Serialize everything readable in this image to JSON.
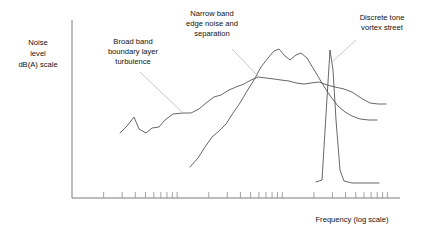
{
  "chart_data": {
    "type": "line",
    "title": "",
    "xlabel": "Frequency (log scale)",
    "ylabel": "Noise level dB(A) scale",
    "xscale": "log",
    "grid": false,
    "legend": "none",
    "axis_ticks_labeled": false,
    "annotations": [
      {
        "id": "broad-band",
        "lines": [
          "Broad band",
          "boundary layer",
          "turbulence"
        ],
        "text": "Broad band boundary layer turbulence",
        "anchor_x": 183,
        "anchor_y": 113
      },
      {
        "id": "narrow-band",
        "lines": [
          "Narrow band",
          "edge noise and",
          "separation"
        ],
        "text": "Narrow band edge noise and separation",
        "anchor_x": 258,
        "anchor_y": 77
      },
      {
        "id": "discrete-tone",
        "lines": [
          "Discrete tone",
          "vortex street"
        ],
        "text": "Discrete tone vortex street",
        "anchor_x": 332,
        "anchor_y": 62
      }
    ],
    "series": [
      {
        "name": "Broad band boundary layer turbulence",
        "points": "120,133 127,126 134,117 139,129 146,133 152,128 159,127 165,120 173,114 183,113 191,113 199,109 206,103 214,97 221,95 229,90 236,87 244,84 251,80 258,77 266,78 274,79 281,80 289,81 296,83 304,84 311,83 319,82 327,85 335,87 344,89 352,92 361,98 370,103 378,104 386,104"
      },
      {
        "name": "Narrow band edge noise and separation",
        "points": "190,167 198,158 205,147 212,137 219,131 226,124 233,113 240,103 247,91 254,80 261,67 268,58 274,51 279,49 285,56 290,60 296,55 301,53 307,58 313,68 319,78 325,88 331,97 338,106 345,112 352,116 360,119 369,120 377,120"
      },
      {
        "name": "Discrete tone vortex street",
        "points": "316,182 322,180 327,98 330,50 333,70 336,120 340,170 344,181 352,183 361,183 370,183 379,183"
      }
    ],
    "axes": {
      "x_start": 72,
      "x_end": 400,
      "y_top": 20,
      "y_bottom": 198,
      "decades": 3,
      "ticks_per_decade": 9
    }
  },
  "labels": {
    "y_axis_line1": "Noise",
    "y_axis_line2": "level",
    "y_axis_line3": "dB(A) scale",
    "x_axis": "Frequency (log scale)",
    "broad_band_line1": "Broad band",
    "broad_band_line2": "boundary layer",
    "broad_band_line3": "turbulence",
    "narrow_band_line1": "Narrow band",
    "narrow_band_line2": "edge noise and",
    "narrow_band_line3": "separation",
    "discrete_tone_line1": "Discrete tone",
    "discrete_tone_line2": "vortex street"
  },
  "colors": {
    "curve": "#4c4c52",
    "leader": "#b9b9bd",
    "axis": "#6e6e73",
    "tick": "#8d8d92",
    "text": "#111111",
    "background": "#ffffff"
  }
}
